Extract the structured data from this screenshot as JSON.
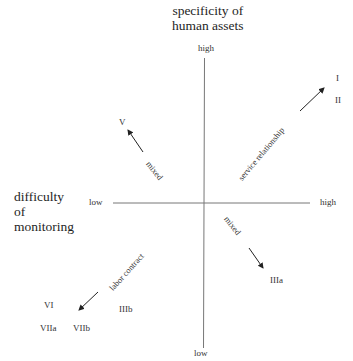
{
  "axes": {
    "vertical": {
      "title_line1": "specificity of",
      "title_line2": "human assets",
      "high_label": "high",
      "low_label": "low"
    },
    "horizontal": {
      "title_line1": "difficulty",
      "title_line2": "of",
      "title_line3": "monitoring",
      "low_label": "low",
      "high_label": "high"
    }
  },
  "quadrants": {
    "upper_right": {
      "arrow_label": "service relationship",
      "categories": [
        "I",
        "II"
      ]
    },
    "upper_left": {
      "arrow_label": "mixed",
      "categories": [
        "V"
      ]
    },
    "lower_right": {
      "arrow_label": "mixed",
      "categories": [
        "IIIa"
      ]
    },
    "lower_left": {
      "arrow_label": "labor contract",
      "categories": [
        "VI",
        "VIIa",
        "VIIb",
        "IIIb"
      ]
    }
  },
  "colors": {
    "line": "#555555",
    "text": "#222222"
  }
}
